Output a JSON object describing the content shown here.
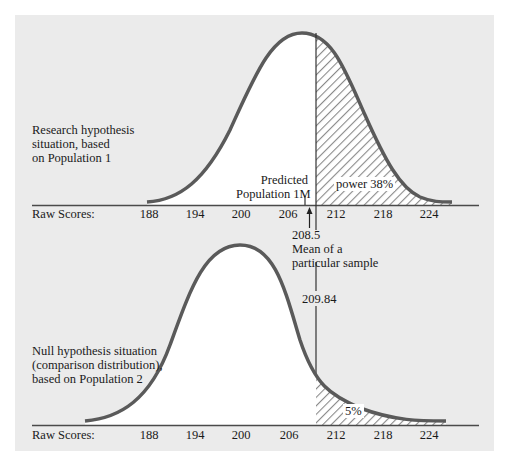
{
  "top_panel": {
    "caption": [
      "Research hypothesis",
      "situation, based",
      "on Population 1"
    ],
    "axis_label": "Raw Scores:",
    "ticks": [
      "188",
      "194",
      "200",
      "206",
      "212",
      "218",
      "224"
    ],
    "predicted_label": [
      "Predicted",
      "Population 1M"
    ],
    "power_label": "power 38%",
    "sample_mean_value": "208.5",
    "sample_mean_label": [
      "Mean of a",
      "particular sample"
    ]
  },
  "bottom_panel": {
    "caption": [
      "Null hypothesis situation",
      "(comparison distribution),",
      "based on Population 2"
    ],
    "axis_label": "Raw Scores:",
    "ticks": [
      "188",
      "194",
      "200",
      "206",
      "212",
      "218",
      "224"
    ],
    "cutoff_value": "209.84",
    "alpha_label": "5%"
  },
  "colors": {
    "panel_bg": "#ebebeb",
    "curve": "#5a5a5a",
    "axis": "#4a4a4a",
    "hatch": "#8a8a8a",
    "fill": "#ffffff"
  },
  "distributions": {
    "population_1_mean": 208,
    "population_2_mean": 200,
    "cutoff": 209.84,
    "sample_mean": 208.5,
    "power_percent": 38,
    "alpha_percent": 5
  }
}
